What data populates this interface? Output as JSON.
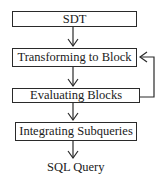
{
  "diagram": {
    "type": "flowchart",
    "nodes": [
      {
        "id": "sdt",
        "label": "SDT"
      },
      {
        "id": "transform",
        "label": "Transforming to Block"
      },
      {
        "id": "evaluate",
        "label": "Evaluating Blocks"
      },
      {
        "id": "integrate",
        "label": "Integrating Subqueries"
      },
      {
        "id": "output",
        "label": "SQL Query"
      }
    ],
    "edges": [
      {
        "from": "sdt",
        "to": "transform"
      },
      {
        "from": "transform",
        "to": "evaluate"
      },
      {
        "from": "evaluate",
        "to": "transform",
        "kind": "feedback-loop"
      },
      {
        "from": "evaluate",
        "to": "integrate"
      },
      {
        "from": "integrate",
        "to": "output"
      }
    ]
  }
}
